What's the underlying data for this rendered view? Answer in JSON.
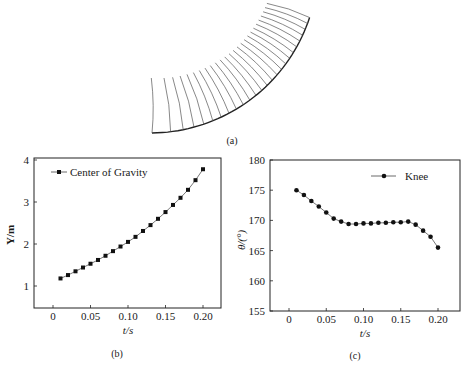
{
  "figure": {
    "panel_a": {
      "caption": "(a)",
      "description": "stick-figure motion sequence along a curved track"
    },
    "panel_b": {
      "caption": "(b)"
    },
    "panel_c": {
      "caption": "(c)"
    }
  },
  "chart_data": [
    {
      "type": "line",
      "panel": "(b)",
      "title": "",
      "xlabel": "t/s",
      "ylabel": "Y/m",
      "x_ticks": [
        "0",
        "0.05",
        "0.10",
        "0.15",
        "0.20"
      ],
      "y_ticks": [
        "1",
        "2",
        "3",
        "4"
      ],
      "xlim": [
        -0.025,
        0.225
      ],
      "ylim": [
        0.5,
        4.05
      ],
      "grid": false,
      "legend_position": "upper left",
      "x": [
        0.01,
        0.02,
        0.03,
        0.04,
        0.05,
        0.06,
        0.07,
        0.08,
        0.09,
        0.1,
        0.11,
        0.12,
        0.13,
        0.14,
        0.15,
        0.16,
        0.17,
        0.18,
        0.19,
        0.2
      ],
      "series": [
        {
          "name": "Center of Gravity",
          "marker": "square",
          "values": [
            1.18,
            1.26,
            1.35,
            1.44,
            1.53,
            1.62,
            1.72,
            1.83,
            1.94,
            2.05,
            2.17,
            2.31,
            2.45,
            2.6,
            2.76,
            2.93,
            3.1,
            3.29,
            3.52,
            3.78
          ]
        }
      ]
    },
    {
      "type": "line",
      "panel": "(c)",
      "title": "",
      "xlabel": "t/s",
      "ylabel": "θ/(°)",
      "x_ticks": [
        "0",
        "0.05",
        "0.10",
        "0.15",
        "0.20"
      ],
      "y_ticks": [
        "155",
        "160",
        "165",
        "170",
        "175",
        "180"
      ],
      "xlim": [
        -0.025,
        0.225
      ],
      "ylim": [
        155,
        180
      ],
      "grid": false,
      "legend_position": "upper right",
      "x": [
        0.01,
        0.02,
        0.03,
        0.04,
        0.05,
        0.06,
        0.07,
        0.08,
        0.09,
        0.1,
        0.11,
        0.12,
        0.13,
        0.14,
        0.15,
        0.16,
        0.17,
        0.18,
        0.19,
        0.2
      ],
      "series": [
        {
          "name": "Knee",
          "marker": "circle",
          "values": [
            175.0,
            174.2,
            173.2,
            172.3,
            171.3,
            170.3,
            169.8,
            169.4,
            169.4,
            169.5,
            169.5,
            169.6,
            169.6,
            169.7,
            169.7,
            169.8,
            169.3,
            168.3,
            167.3,
            165.5
          ]
        }
      ]
    }
  ]
}
